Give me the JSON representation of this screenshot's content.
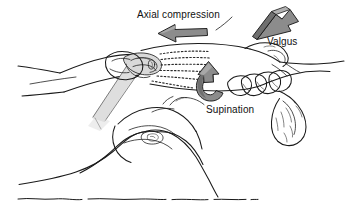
{
  "figure": {
    "width": 345,
    "height": 220,
    "background_color": "#ffffff",
    "line_color": "#1a1a1a",
    "arrow_fill_color": "#8c8c8c",
    "bone_shade_color": "#d9d9d9"
  },
  "labels": {
    "axial_compression": "Axial compression",
    "valgus": "Valgus",
    "supination": "Supination"
  },
  "annotations": [
    {
      "id": "axial-compression",
      "label": "Axial compression",
      "arrow_type": "flat-straight-arrow",
      "direction": "left",
      "color": "#8c8c8c"
    },
    {
      "id": "valgus",
      "label": "Valgus",
      "arrow_type": "block-3d-arrow",
      "direction": "down-left",
      "color": "#8c8c8c"
    },
    {
      "id": "supination",
      "label": "Supination",
      "arrow_type": "curved-rotation-arrow",
      "direction": "counterclockwise-up",
      "color": "#8c8c8c"
    }
  ]
}
